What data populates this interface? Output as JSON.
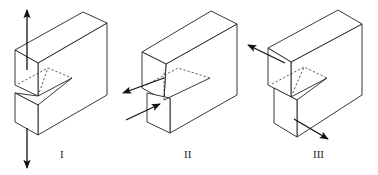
{
  "figure": {
    "modes": [
      {
        "label": "I",
        "name": "mode-i-opening"
      },
      {
        "label": "II",
        "name": "mode-ii-sliding"
      },
      {
        "label": "III",
        "name": "mode-iii-tearing"
      }
    ]
  }
}
